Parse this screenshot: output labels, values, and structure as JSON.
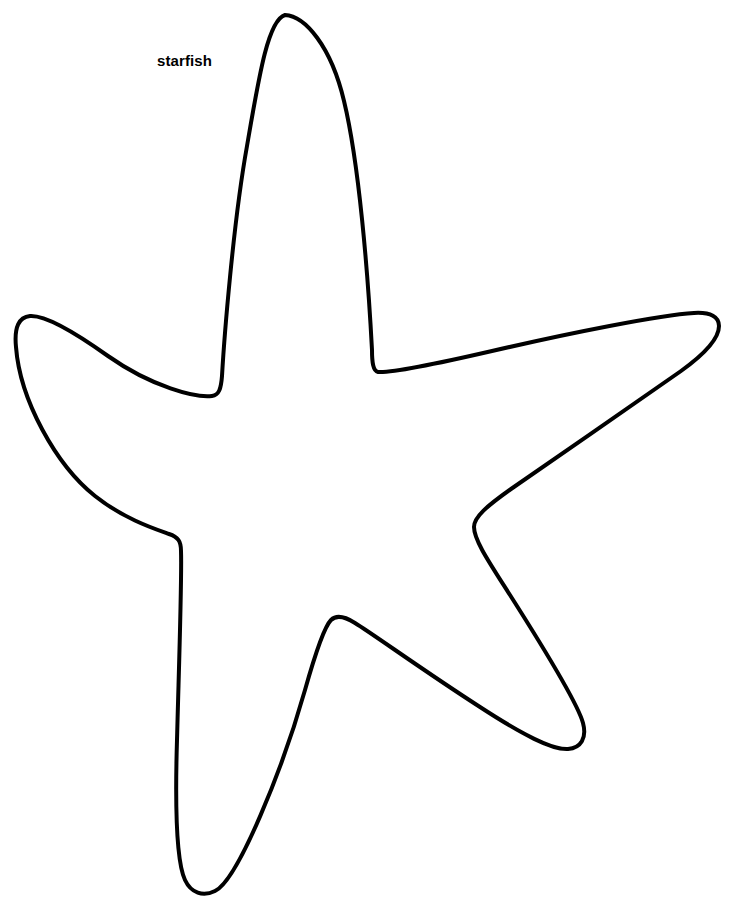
{
  "page": {
    "title": "starfish",
    "background_color": "#ffffff",
    "width": 741,
    "height": 913
  },
  "label": {
    "text": "starfish",
    "color": "#000000",
    "x": 157,
    "y": 52,
    "font_size_px": 15,
    "font_weight": "bold"
  },
  "drawing": {
    "name": "starfish-outline",
    "type": "line-art-stencil",
    "stroke_color": "#000000",
    "fill_color": "none",
    "stroke_width_px": 4,
    "arm_count": 5,
    "points": {
      "top_tip": [
        285,
        15
      ],
      "valley_top_left": [
        215,
        395
      ],
      "valley_top_right": [
        372,
        372
      ],
      "left_tip": [
        16,
        318
      ],
      "valley_left_lower": [
        181,
        545
      ],
      "right_tip": [
        718,
        322
      ],
      "valley_right_lower": [
        443,
        508
      ],
      "bottom_left_tip": [
        180,
        893
      ],
      "valley_bottom": [
        330,
        620
      ],
      "bottom_right_tip": [
        583,
        748
      ]
    },
    "path": "M 285 15 C 305 16 331 46 344 101 C 359 163 368 274 372 350 C 372 362 373 371 378 372 C 392 373 440 363 492 351 C 570 333 660 315 694 313 C 711 312 719 317 719 326 C 719 338 706 353 681 371 C 640 400 560 455 511 489 C 487 506 474 517 474 527 C 474 540 489 562 510 595 C 545 650 578 704 583 723 C 587 738 581 748 568 749 C 552 750 523 735 480 707 C 424 671 373 634 355 623 C 344 616 336 615 331 620 C 324 627 316 651 305 690 C 283 768 238 880 215 891 C 203 897 191 893 185 880 C 176 861 175 806 177 740 C 179 664 182 578 181 551 C 181 541 178 537 169 534 C 155 529 124 519 95 496 C 56 465 20 400 16 347 C 14 327 19 317 30 316 C 45 315 73 331 108 356 C 152 387 196 398 212 396 C 219 395 221 389 222 376 C 224 341 233 224 247 146 C 259 76 268 20 285 15 Z"
  }
}
